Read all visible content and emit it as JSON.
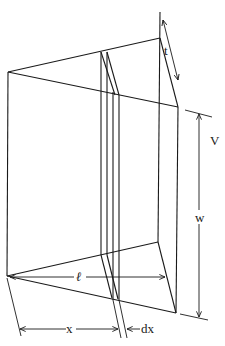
{
  "figure": {
    "labels": {
      "t": "t",
      "V": "V",
      "w": "w",
      "l": "ℓ",
      "x": "x",
      "dx": "dx"
    },
    "colors": {
      "stroke": "#1a1a1a",
      "background": "#ffffff"
    }
  }
}
